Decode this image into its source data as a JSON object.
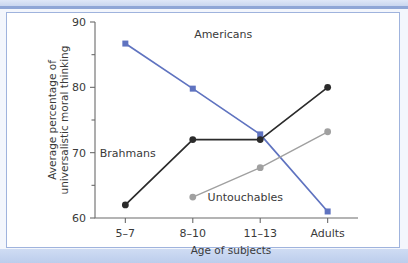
{
  "figure": {
    "background_color": "#f3f6fc",
    "panel_color": "#ffffff",
    "border_color": "#9fb3dd"
  },
  "chart_data": {
    "type": "line",
    "title": "",
    "xlabel": "Age of subjects",
    "ylabel": "Average percentage of universalistic moral thinking",
    "ylabel_line1": "Average percentage of",
    "ylabel_line2": "universalistic moral thinking",
    "categories": [
      "5–7",
      "8–10",
      "11–13",
      "Adults"
    ],
    "x": [
      0,
      1,
      2,
      3
    ],
    "ylim": [
      60,
      90
    ],
    "xlim": [
      -0.45,
      3.45
    ],
    "yticks": [
      60,
      70,
      80,
      90
    ],
    "ytick_labels": [
      "60",
      "70",
      "80",
      "90"
    ],
    "yminor_ticks": [
      65,
      75,
      85
    ],
    "grid": false,
    "legend_position": "inline-annotations",
    "series": [
      {
        "name": "Americans",
        "color": "#5f73c0",
        "marker": "square",
        "values": [
          86.7,
          79.8,
          72.8,
          61.0
        ],
        "label_x": 1.02,
        "label_y": 87.6,
        "label_anchor": "start"
      },
      {
        "name": "Brahmans",
        "color": "#2b2b2b",
        "marker": "circle",
        "values": [
          62.0,
          72.0,
          72.0,
          80.0
        ],
        "label_x": -0.38,
        "label_y": 69.3,
        "label_anchor": "start"
      },
      {
        "name": "Untouchables",
        "color": "#a0a0a0",
        "marker": "circle",
        "values": [
          null,
          63.2,
          67.7,
          73.2
        ],
        "label_x": 1.22,
        "label_y": 62.6,
        "label_anchor": "start"
      }
    ],
    "annotations": [
      {
        "text": "Americans",
        "series": "Americans"
      },
      {
        "text": "Brahmans",
        "series": "Brahmans"
      },
      {
        "text": "Untouchables",
        "series": "Untouchables"
      }
    ]
  }
}
